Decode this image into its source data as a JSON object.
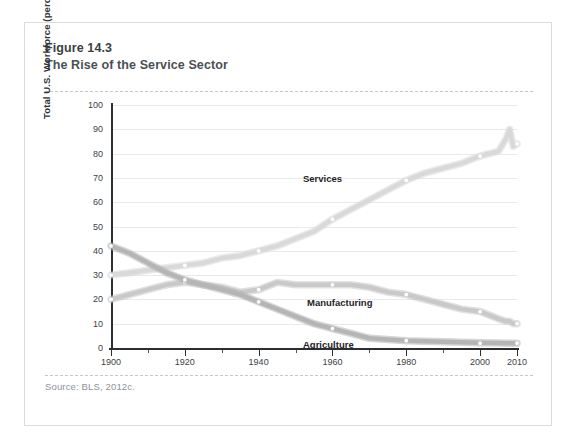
{
  "figure": {
    "number": "Figure 14.3",
    "title": "The Rise of the Service Sector",
    "source": "Source: BLS, 2012c."
  },
  "chart_data": {
    "type": "line",
    "title": "The Rise of the Service Sector",
    "xlabel": "",
    "ylabel": "Total U.S. Workforce (percent)",
    "xlim": [
      1900,
      2010
    ],
    "ylim": [
      0,
      100
    ],
    "grid": true,
    "legend": "inline-labels",
    "y_ticks": [
      0,
      10,
      20,
      30,
      40,
      50,
      60,
      70,
      80,
      90,
      100
    ],
    "x_ticks": [
      1900,
      1920,
      1940,
      1960,
      1980,
      2000,
      2010
    ],
    "x_minor_ticks": [
      1910,
      1930,
      1950,
      1970,
      1990
    ],
    "x": [
      1900,
      1905,
      1910,
      1915,
      1920,
      1925,
      1930,
      1935,
      1940,
      1945,
      1950,
      1955,
      1960,
      1965,
      1970,
      1975,
      1980,
      1985,
      1990,
      1995,
      2000,
      2005,
      2007,
      2008,
      2009,
      2010
    ],
    "series": [
      {
        "name": "Services",
        "color": "#d9d9d9",
        "marker_years": [
          1900,
          1920,
          1940,
          1960,
          1980,
          2000,
          2010
        ],
        "marker_values": [
          30,
          34,
          40,
          53,
          69,
          79,
          84
        ],
        "values": [
          30,
          31,
          32,
          33,
          34,
          35,
          37,
          38,
          40,
          42,
          45,
          48,
          53,
          57,
          61,
          65,
          69,
          72,
          74,
          76,
          79,
          81,
          86,
          90,
          83,
          84
        ]
      },
      {
        "name": "Manufacturing",
        "color": "#c9c9c9",
        "marker_years": [
          1900,
          1920,
          1940,
          1960,
          1980,
          2000,
          2010
        ],
        "marker_values": [
          20,
          27,
          24,
          26,
          22,
          15,
          10
        ],
        "values": [
          20,
          22,
          24,
          26,
          27,
          26,
          25,
          23,
          24,
          27,
          26,
          26,
          26,
          26,
          25,
          23,
          22,
          20,
          18,
          16,
          15,
          12,
          11,
          11,
          10,
          10
        ]
      },
      {
        "name": "Agriculture",
        "color": "#b5b5b5",
        "marker_years": [
          1900,
          1920,
          1940,
          1960,
          1980,
          2000,
          2010
        ],
        "marker_values": [
          42,
          28,
          19,
          8,
          3,
          2,
          2
        ],
        "values": [
          42,
          39,
          35,
          31,
          28,
          26,
          24,
          22,
          19,
          16,
          13,
          10,
          8,
          6,
          4,
          3.5,
          3,
          2.8,
          2.6,
          2.4,
          2.2,
          2.1,
          2,
          2,
          2,
          2
        ]
      }
    ]
  },
  "axis": {
    "y_title": "Total U.S. Workforce (percent)",
    "y_labels": [
      "100",
      "90",
      "80",
      "70",
      "60",
      "50",
      "40",
      "30",
      "20",
      "10",
      "0"
    ],
    "x_labels": [
      "1900",
      "1920",
      "1940",
      "1960",
      "1980",
      "2000",
      "2010"
    ]
  },
  "labels": {
    "services": "Services",
    "manufacturing": "Manufacturing",
    "agriculture": "Agriculture"
  }
}
